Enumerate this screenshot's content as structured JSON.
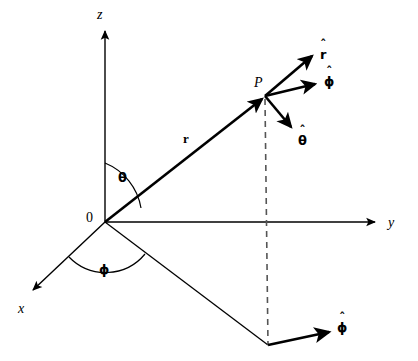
{
  "figure": {
    "type": "diagram",
    "background_color": "#ffffff",
    "stroke_color": "#000000",
    "axes": {
      "z": {
        "label": "z",
        "label_x": 97,
        "label_y": 10,
        "from": [
          105,
          222
        ],
        "to": [
          105,
          30
        ],
        "arrow": true
      },
      "y": {
        "label": "y",
        "label_x": 388,
        "label_y": 218,
        "from": [
          105,
          222
        ],
        "to": [
          376,
          222
        ],
        "arrow": true
      },
      "x": {
        "label": "x",
        "label_x": 18,
        "label_y": 303,
        "from": [
          105,
          222
        ],
        "to": [
          32,
          291
        ],
        "arrow": true
      }
    },
    "origin": {
      "label": "0",
      "label_x": 86,
      "label_y": 212,
      "point": [
        105,
        222
      ]
    },
    "point_p": {
      "label": "P",
      "label_x": 255,
      "label_y": 78,
      "point": [
        265,
        96
      ]
    },
    "position_vector": {
      "label": "r",
      "label_x": 183,
      "label_y": 134,
      "from": [
        105,
        222
      ],
      "to": [
        265,
        96
      ],
      "bold": true
    },
    "angles": [
      {
        "name": "theta",
        "label": "θ",
        "label_x": 118,
        "label_y": 172
      },
      {
        "name": "phi",
        "label": "ϕ",
        "label_x": 99,
        "label_y": 264
      }
    ],
    "unit_vectors": [
      {
        "name": "r-hat",
        "symbol": "r",
        "hat": "ˆ",
        "label_x": 320,
        "label_y": 46,
        "from": [
          265,
          96
        ],
        "to": [
          313,
          55
        ]
      },
      {
        "name": "phi-hat-at-p",
        "symbol": "ϕ",
        "hat": "ˆ",
        "label_x": 324,
        "label_y": 74,
        "from": [
          265,
          96
        ],
        "to": [
          316,
          83
        ]
      },
      {
        "name": "theta-hat",
        "symbol": "θ",
        "hat": "ˆ",
        "label_x": 299,
        "label_y": 134,
        "from": [
          265,
          96
        ],
        "to": [
          292,
          128
        ]
      },
      {
        "name": "phi-hat-at-base",
        "symbol": "ϕ",
        "hat": "ˆ",
        "label_x": 337,
        "label_y": 321,
        "from": [
          268,
          345
        ],
        "to": [
          331,
          331
        ]
      }
    ],
    "projection": {
      "base_point": [
        268,
        345
      ],
      "dashed_line": {
        "from": [
          265,
          100
        ],
        "to": [
          268,
          345
        ]
      },
      "ground_line": {
        "from": [
          105,
          222
        ],
        "to": [
          268,
          345
        ]
      }
    }
  }
}
